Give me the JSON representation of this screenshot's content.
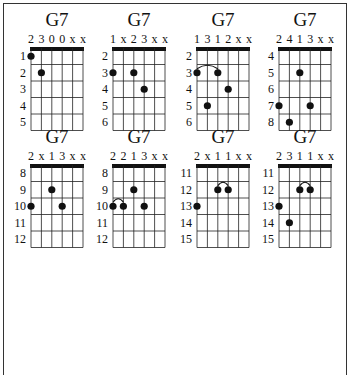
{
  "chart_data": {
    "type": "table",
    "chords": [
      {
        "name": "G7",
        "fingers": [
          "2",
          "3",
          "0",
          "0",
          "x",
          "x"
        ],
        "start_fret": 1,
        "frets": [
          "1",
          "2",
          "3",
          "4",
          "5"
        ],
        "dots": [
          {
            "string": 0,
            "row": 0
          },
          {
            "string": 1,
            "row": 1
          }
        ],
        "barre": null
      },
      {
        "name": "G7",
        "fingers": [
          "1",
          "x",
          "2",
          "3",
          "x",
          "x"
        ],
        "start_fret": 2,
        "frets": [
          "2",
          "3",
          "4",
          "5",
          "6"
        ],
        "dots": [
          {
            "string": 0,
            "row": 1
          },
          {
            "string": 2,
            "row": 1
          },
          {
            "string": 3,
            "row": 2
          }
        ],
        "barre": null
      },
      {
        "name": "G7",
        "fingers": [
          "1",
          "3",
          "1",
          "2",
          "x",
          "x"
        ],
        "start_fret": 2,
        "frets": [
          "2",
          "3",
          "4",
          "5",
          "6"
        ],
        "dots": [
          {
            "string": 0,
            "row": 1
          },
          {
            "string": 2,
            "row": 1
          },
          {
            "string": 3,
            "row": 2
          },
          {
            "string": 1,
            "row": 3
          }
        ],
        "barre": {
          "from": 0,
          "to": 2,
          "row": 1
        }
      },
      {
        "name": "G7",
        "fingers": [
          "2",
          "4",
          "1",
          "3",
          "x",
          "x"
        ],
        "start_fret": 4,
        "frets": [
          "4",
          "5",
          "6",
          "7",
          "8"
        ],
        "dots": [
          {
            "string": 2,
            "row": 1
          },
          {
            "string": 0,
            "row": 3
          },
          {
            "string": 3,
            "row": 3
          },
          {
            "string": 1,
            "row": 4
          }
        ],
        "barre": null
      },
      {
        "name": "G7",
        "fingers": [
          "2",
          "x",
          "1",
          "3",
          "x",
          "x"
        ],
        "start_fret": 8,
        "frets": [
          "8",
          "9",
          "10",
          "11",
          "12"
        ],
        "dots": [
          {
            "string": 2,
            "row": 1
          },
          {
            "string": 0,
            "row": 2
          },
          {
            "string": 3,
            "row": 2
          }
        ],
        "barre": null
      },
      {
        "name": "G7",
        "fingers": [
          "2",
          "2",
          "1",
          "3",
          "x",
          "x"
        ],
        "start_fret": 8,
        "frets": [
          "8",
          "9",
          "10",
          "11",
          "12"
        ],
        "dots": [
          {
            "string": 2,
            "row": 1
          },
          {
            "string": 0,
            "row": 2
          },
          {
            "string": 1,
            "row": 2
          },
          {
            "string": 3,
            "row": 2
          }
        ],
        "barre": {
          "from": 0,
          "to": 1,
          "row": 2
        }
      },
      {
        "name": "G7",
        "fingers": [
          "2",
          "x",
          "1",
          "1",
          "x",
          "x"
        ],
        "start_fret": 11,
        "frets": [
          "11",
          "12",
          "13",
          "14",
          "15"
        ],
        "dots": [
          {
            "string": 2,
            "row": 1
          },
          {
            "string": 3,
            "row": 1
          },
          {
            "string": 0,
            "row": 2
          }
        ],
        "barre": {
          "from": 2,
          "to": 3,
          "row": 1
        }
      },
      {
        "name": "G7",
        "fingers": [
          "2",
          "3",
          "1",
          "1",
          "x",
          "x"
        ],
        "start_fret": 11,
        "frets": [
          "11",
          "12",
          "13",
          "14",
          "15"
        ],
        "dots": [
          {
            "string": 2,
            "row": 1
          },
          {
            "string": 3,
            "row": 1
          },
          {
            "string": 0,
            "row": 2
          },
          {
            "string": 1,
            "row": 3
          }
        ],
        "barre": {
          "from": 2,
          "to": 3,
          "row": 1
        }
      }
    ]
  }
}
